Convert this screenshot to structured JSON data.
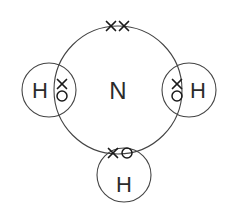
{
  "diagram": {
    "type": "dot-and-cross-diagram",
    "canvas": {
      "width": 238,
      "height": 210,
      "background": "#ffffff"
    },
    "stroke_color": "#444444",
    "mark_color": "#1a1a1a",
    "text_color": "#2b2b2b",
    "central_atom": {
      "label": "N",
      "name": "nitrogen",
      "x": 118,
      "y": 90,
      "shell_radius": 64
    },
    "outer_atoms": [
      {
        "label": "H",
        "name": "hydrogen-left",
        "circle_x": 49,
        "circle_y": 90,
        "radius": 27,
        "label_x": 40,
        "label_y": 90
      },
      {
        "label": "H",
        "name": "hydrogen-right",
        "circle_x": 189,
        "circle_y": 90,
        "radius": 27,
        "label_x": 198,
        "label_y": 90
      },
      {
        "label": "H",
        "name": "hydrogen-bottom",
        "circle_x": 124,
        "circle_y": 175,
        "radius": 27,
        "label_x": 124,
        "label_y": 184
      }
    ],
    "electrons": {
      "lone_pair_crosses": [
        {
          "x": 111,
          "y": 26,
          "symbol": "x"
        },
        {
          "x": 124,
          "y": 26,
          "symbol": "x"
        }
      ],
      "bonding_pairs": [
        {
          "bond": "N-H-left",
          "cross": {
            "x": 62,
            "y": 84
          },
          "dot": {
            "x": 62,
            "y": 96
          }
        },
        {
          "bond": "N-H-right",
          "cross": {
            "x": 177,
            "y": 84
          },
          "dot": {
            "x": 177,
            "y": 96
          }
        },
        {
          "bond": "N-H-bottom",
          "cross": {
            "x": 113,
            "y": 153
          },
          "dot": {
            "x": 127,
            "y": 153
          }
        }
      ]
    },
    "legend": {
      "cross_meaning": "electron from nitrogen",
      "dot_meaning": "electron from hydrogen"
    }
  }
}
